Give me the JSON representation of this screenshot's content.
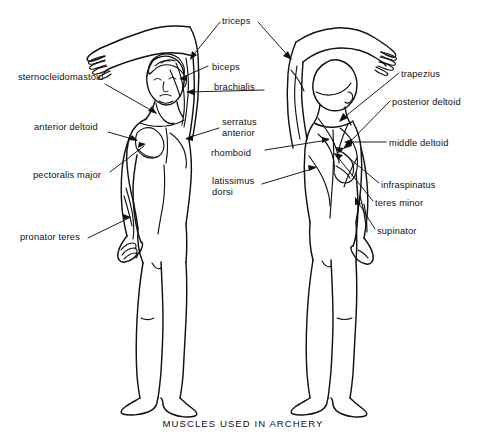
{
  "figure": {
    "caption": "MUSCLES USED IN ARCHERY",
    "background_color": "#ffffff",
    "ink_color": "#14100f",
    "view_left": "anterior (front) view of archer",
    "view_right": "posterior (back) view of archer"
  },
  "labels": [
    {
      "id": "sternocleidomastoid",
      "text": "sternocleidomastoid",
      "align": "left",
      "x": 18,
      "y": 72,
      "side": "front"
    },
    {
      "id": "anterior-deltoid",
      "text": "anterior deltoid",
      "align": "left",
      "x": 34,
      "y": 122,
      "side": "front"
    },
    {
      "id": "pectoralis-major",
      "text": "pectoralis major",
      "align": "left",
      "x": 33,
      "y": 170,
      "side": "front"
    },
    {
      "id": "pronator-teres",
      "text": "pronator teres",
      "align": "left",
      "x": 20,
      "y": 232,
      "side": "front"
    },
    {
      "id": "triceps",
      "text": "triceps",
      "align": "left",
      "x": 222,
      "y": 16,
      "side": "front"
    },
    {
      "id": "biceps",
      "text": "biceps",
      "align": "left",
      "x": 212,
      "y": 62,
      "side": "front"
    },
    {
      "id": "brachialis",
      "text": "brachialis",
      "align": "left",
      "x": 214,
      "y": 82,
      "side": "front"
    },
    {
      "id": "serratus-anterior",
      "text": "serratus\nanterior",
      "align": "left",
      "x": 222,
      "y": 117,
      "side": "front"
    },
    {
      "id": "rhomboid",
      "text": "rhomboid",
      "align": "left",
      "x": 219,
      "y": 148,
      "side": "back"
    },
    {
      "id": "latissimus-dorsi",
      "text": "latissimus\ndorsi",
      "align": "left",
      "x": 212,
      "y": 176,
      "side": "back"
    },
    {
      "id": "trapezius",
      "text": "trapezius",
      "align": "left",
      "x": 401,
      "y": 69,
      "side": "back"
    },
    {
      "id": "posterior-deltoid",
      "text": "posterior deltoid",
      "align": "left",
      "x": 392,
      "y": 97,
      "side": "back"
    },
    {
      "id": "middle-deltoid",
      "text": "middle deltoid",
      "align": "left",
      "x": 389,
      "y": 138,
      "side": "back"
    },
    {
      "id": "infraspinatus",
      "text": "infraspinatus",
      "align": "left",
      "x": 381,
      "y": 180,
      "side": "back"
    },
    {
      "id": "teres-minor",
      "text": "teres minor",
      "align": "left",
      "x": 375,
      "y": 198,
      "side": "back"
    },
    {
      "id": "supinator",
      "text": "supinator",
      "align": "left",
      "x": 377,
      "y": 226,
      "side": "back"
    }
  ]
}
